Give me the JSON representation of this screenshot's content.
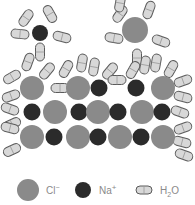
{
  "diagram": {
    "colors": {
      "cl": "#8a8a8a",
      "na": "#2b2b2b",
      "water_fill": "#d8d8d8",
      "water_stroke": "#5a5a5a",
      "text": "#8a8a8a"
    },
    "free_ions": [
      {
        "type": "Na",
        "x": 40,
        "y": 33,
        "r": 8,
        "waters": [
          [
            26,
            18,
            -55
          ],
          [
            50,
            14,
            60
          ],
          [
            20,
            34,
            5
          ],
          [
            62,
            37,
            15
          ],
          [
            40,
            52,
            90
          ]
        ]
      },
      {
        "type": "Cl",
        "x": 135,
        "y": 30,
        "r": 13,
        "waters": [
          [
            120,
            14,
            -55
          ],
          [
            149,
            10,
            -70
          ],
          [
            114,
            38,
            10
          ],
          [
            161,
            41,
            20
          ],
          [
            137,
            58,
            90
          ]
        ]
      }
    ],
    "crystal": {
      "rows": [
        {
          "y": 88,
          "ions": [
            {
              "type": "Cl",
              "x": 32
            },
            {
              "type": "Cl",
              "x": 78
            },
            {
              "type": "Na",
              "x": 99
            },
            {
              "type": "Na",
              "x": 136
            },
            {
              "type": "Cl",
              "x": 163
            }
          ]
        },
        {
          "y": 112,
          "ions": [
            {
              "type": "Na",
              "x": 32
            },
            {
              "type": "Cl",
              "x": 55
            },
            {
              "type": "Na",
              "x": 79
            },
            {
              "type": "Cl",
              "x": 98
            },
            {
              "type": "Na",
              "x": 118
            },
            {
              "type": "Cl",
              "x": 142
            },
            {
              "type": "Na",
              "x": 162
            }
          ]
        },
        {
          "y": 137,
          "ions": [
            {
              "type": "Cl",
              "x": 32
            },
            {
              "type": "Na",
              "x": 54
            },
            {
              "type": "Cl",
              "x": 78
            },
            {
              "type": "Na",
              "x": 98
            },
            {
              "type": "Cl",
              "x": 120
            },
            {
              "type": "Na",
              "x": 141
            },
            {
              "type": "Cl",
              "x": 163
            }
          ]
        }
      ],
      "surface_waters": [
        [
          28,
          62,
          -70
        ],
        [
          47,
          71,
          -50
        ],
        [
          12,
          77,
          -30
        ],
        [
          11,
          96,
          -20
        ],
        [
          66,
          69,
          -60
        ],
        [
          82,
          63,
          -80
        ],
        [
          94,
          67,
          -80
        ],
        [
          110,
          71,
          -50
        ],
        [
          117,
          80,
          0
        ],
        [
          133,
          70,
          -60
        ],
        [
          145,
          65,
          -80
        ],
        [
          156,
          63,
          -80
        ],
        [
          171,
          69,
          -60
        ],
        [
          183,
          81,
          -20
        ],
        [
          183,
          97,
          15
        ],
        [
          10,
          109,
          20
        ],
        [
          12,
          124,
          -25
        ],
        [
          10,
          128,
          15
        ],
        [
          12,
          150,
          -25
        ],
        [
          180,
          112,
          20
        ],
        [
          183,
          128,
          -20
        ],
        [
          182,
          142,
          15
        ],
        [
          184,
          155,
          20
        ],
        [
          120,
          3,
          -80
        ],
        [
          60,
          88,
          0
        ]
      ]
    },
    "legend": {
      "items": [
        {
          "label_main": "Cl",
          "label_sup": "−",
          "symbol": "cl-circle"
        },
        {
          "label_main": "Na",
          "label_sup": "+",
          "symbol": "na-circle"
        },
        {
          "label_main": "H",
          "label_sub": "2",
          "label_tail": "O",
          "symbol": "water-capsule"
        }
      ]
    }
  }
}
